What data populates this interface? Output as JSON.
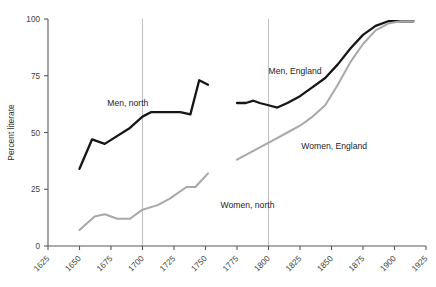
{
  "chart_data": {
    "type": "line",
    "title": "",
    "xlabel": "",
    "ylabel": "Percent literate",
    "xlim": [
      1625,
      1925
    ],
    "ylim": [
      0,
      100
    ],
    "grid": "vertical gridlines at 1700 and 1800 only",
    "legend": "inline labels next to each series",
    "x_ticks": [
      1625,
      1650,
      1675,
      1700,
      1725,
      1750,
      1775,
      1800,
      1825,
      1850,
      1875,
      1900,
      1925
    ],
    "x_tick_labels": [
      "1625",
      "1650",
      "1675",
      "1700",
      "1725",
      "1750",
      "1775",
      "1800",
      "1825",
      "1850",
      "1875",
      "1900",
      "1925"
    ],
    "y_ticks": [
      0,
      25,
      50,
      75,
      100
    ],
    "y_tick_labels": [
      "0",
      "25",
      "50",
      "75",
      "100"
    ],
    "gridlines_x": [
      1700,
      1800
    ],
    "series": [
      {
        "name": "Men, north",
        "label": "Men, north",
        "color": "#161616",
        "style": "dark",
        "label_x": 1672,
        "label_y": 63,
        "points": [
          [
            1650,
            34
          ],
          [
            1660,
            47
          ],
          [
            1670,
            45
          ],
          [
            1690,
            52
          ],
          [
            1700,
            57
          ],
          [
            1707,
            59
          ],
          [
            1730,
            59
          ],
          [
            1738,
            58
          ],
          [
            1745,
            73
          ],
          [
            1752,
            71
          ]
        ]
      },
      {
        "name": "Women, north",
        "label": "Women, north",
        "color": "#a8a8aa",
        "style": "light",
        "label_x": 1762,
        "label_y": 18,
        "points": [
          [
            1650,
            7
          ],
          [
            1662,
            13
          ],
          [
            1670,
            14
          ],
          [
            1680,
            12
          ],
          [
            1690,
            12
          ],
          [
            1700,
            16
          ],
          [
            1712,
            18
          ],
          [
            1722,
            21
          ],
          [
            1735,
            26
          ],
          [
            1742,
            26
          ],
          [
            1752,
            32
          ]
        ]
      },
      {
        "name": "Men, England",
        "label": "Men, England",
        "color": "#161616",
        "style": "dark",
        "label_x": 1800,
        "label_y": 77,
        "points": [
          [
            1775,
            63
          ],
          [
            1782,
            63
          ],
          [
            1788,
            64
          ],
          [
            1793,
            63
          ],
          [
            1800,
            62
          ],
          [
            1807,
            61
          ],
          [
            1815,
            63
          ],
          [
            1825,
            66
          ],
          [
            1835,
            70
          ],
          [
            1845,
            74
          ],
          [
            1855,
            80
          ],
          [
            1865,
            87
          ],
          [
            1875,
            93
          ],
          [
            1885,
            97
          ],
          [
            1895,
            99
          ],
          [
            1905,
            99
          ],
          [
            1915,
            99
          ]
        ]
      },
      {
        "name": "Women, England",
        "label": "Women, England",
        "color": "#a8a8aa",
        "style": "light",
        "label_x": 1826,
        "label_y": 44,
        "points": [
          [
            1775,
            38
          ],
          [
            1785,
            41
          ],
          [
            1795,
            44
          ],
          [
            1805,
            47
          ],
          [
            1815,
            50
          ],
          [
            1825,
            53
          ],
          [
            1835,
            57
          ],
          [
            1845,
            62
          ],
          [
            1855,
            71
          ],
          [
            1865,
            81
          ],
          [
            1875,
            89
          ],
          [
            1885,
            95
          ],
          [
            1895,
            98
          ],
          [
            1905,
            99
          ],
          [
            1915,
            99
          ]
        ]
      }
    ]
  }
}
